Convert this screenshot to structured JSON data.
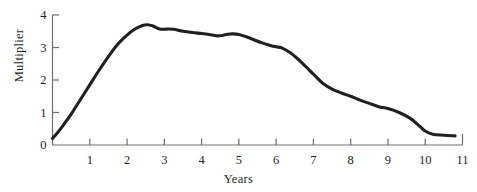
{
  "chart_data": {
    "type": "line",
    "title": "",
    "xlabel": "Years",
    "ylabel": "Multiplier",
    "xlim": [
      0,
      11
    ],
    "ylim": [
      0,
      4
    ],
    "grid": false,
    "legend": null,
    "xticks": [
      "1",
      "2",
      "3",
      "4",
      "5",
      "6",
      "7",
      "8",
      "9",
      "10",
      "11"
    ],
    "xtick_values": [
      1,
      2,
      3,
      4,
      5,
      6,
      7,
      8,
      9,
      10,
      11
    ],
    "yticks": [
      "0",
      "1",
      "2",
      "3",
      "4"
    ],
    "ytick_values": [
      0,
      1,
      2,
      3,
      4
    ],
    "series": [
      {
        "name": "Multiplier",
        "color": "#231f20",
        "line_width": 3.1,
        "x": [
          0.0,
          0.1,
          0.25,
          0.5,
          0.75,
          1.0,
          1.25,
          1.5,
          1.75,
          2.0,
          2.2,
          2.4,
          2.55,
          2.7,
          2.85,
          3.0,
          3.1,
          3.25,
          3.5,
          3.75,
          4.0,
          4.2,
          4.4,
          4.55,
          4.7,
          4.85,
          5.0,
          5.2,
          5.4,
          5.6,
          5.8,
          6.0,
          6.15,
          6.4,
          6.7,
          7.0,
          7.25,
          7.5,
          7.75,
          8.0,
          8.25,
          8.5,
          8.75,
          9.0,
          9.3,
          9.6,
          9.85,
          10.0,
          10.2,
          10.5,
          10.8
        ],
        "y": [
          0.2,
          0.33,
          0.55,
          0.95,
          1.4,
          1.85,
          2.3,
          2.72,
          3.1,
          3.38,
          3.56,
          3.67,
          3.7,
          3.66,
          3.58,
          3.56,
          3.57,
          3.56,
          3.5,
          3.46,
          3.43,
          3.4,
          3.36,
          3.37,
          3.41,
          3.42,
          3.4,
          3.33,
          3.24,
          3.15,
          3.08,
          3.02,
          2.99,
          2.82,
          2.52,
          2.18,
          1.9,
          1.72,
          1.6,
          1.5,
          1.38,
          1.28,
          1.18,
          1.12,
          1.0,
          0.82,
          0.58,
          0.43,
          0.33,
          0.3,
          0.28
        ]
      }
    ]
  },
  "axes": {
    "x_title": "Years",
    "y_title": "Multiplier",
    "axis_color": "#6e6e6e",
    "text_color": "#231f20"
  }
}
